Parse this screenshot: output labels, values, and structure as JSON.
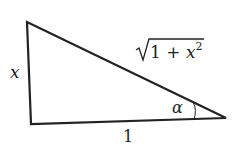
{
  "diagram": {
    "type": "right-triangle",
    "vertices": {
      "top_left": [
        27,
        22
      ],
      "bottom_left": [
        31,
        124
      ],
      "bottom_right": [
        226,
        118
      ]
    },
    "labels": {
      "vertical_side": "x",
      "horizontal_side": "1",
      "hypotenuse_radicand_1": "1 + ",
      "hypotenuse_var": "x",
      "hypotenuse_exp": "2",
      "angle": "α"
    },
    "colors": {
      "stroke": "#222222",
      "background": "#ffffff"
    }
  }
}
